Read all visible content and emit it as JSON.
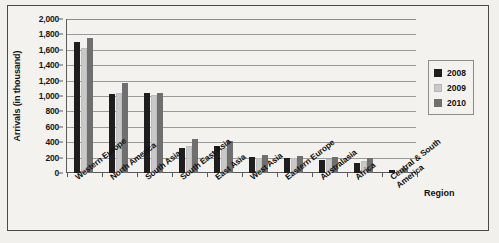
{
  "chart_data": {
    "type": "bar",
    "title": "",
    "xlabel": "Region",
    "ylabel": "Arrivals (in thousand)",
    "ylim": [
      0,
      2000
    ],
    "ytick_step": 200,
    "grid": true,
    "legend_position": "right",
    "categories": [
      "Western Europe",
      "North America",
      "South Asia",
      "South East Asia",
      "East Asia",
      "West Asia",
      "Eastern Europe",
      "Australasia",
      "Africa",
      "Central & South America"
    ],
    "ytick_labels": [
      "0",
      "200",
      "400",
      "600",
      "800",
      "1,000",
      "1,200",
      "1,400",
      "1,600",
      "1,800",
      "2,000"
    ],
    "series": [
      {
        "name": "2008",
        "color": "#1e1e1e",
        "values": [
          1700,
          1020,
          1045,
          330,
          350,
          205,
          190,
          175,
          135,
          40
        ]
      },
      {
        "name": "2009",
        "color": "#c9c9c9",
        "values": [
          1630,
          1040,
          1010,
          345,
          330,
          200,
          190,
          185,
          160,
          45
        ]
      },
      {
        "name": "2010",
        "color": "#6f6f6f",
        "values": [
          1750,
          1170,
          1035,
          440,
          410,
          235,
          220,
          210,
          200,
          60
        ]
      }
    ]
  },
  "legend": {
    "entries": [
      {
        "label": "2008"
      },
      {
        "label": "2009"
      },
      {
        "label": "2010"
      }
    ]
  },
  "colors": {
    "series_2008": "#1e1e1e",
    "series_2009": "#c9c9c9",
    "series_2010": "#6f6f6f",
    "page_background": "#f2f0ec",
    "plot_background": "#f4f2ee",
    "gridline": "#9a9a9a",
    "axis": "#5a5a5a",
    "text": "#111111"
  }
}
